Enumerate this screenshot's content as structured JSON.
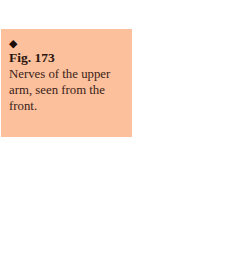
{
  "caption": {
    "marker_icon": "diamond-bullet",
    "marker_glyph": "◆",
    "figure_label": "Fig. 173",
    "text": "Nerves of the upper arm, seen from the front.",
    "background_color": "#fcc09c"
  }
}
